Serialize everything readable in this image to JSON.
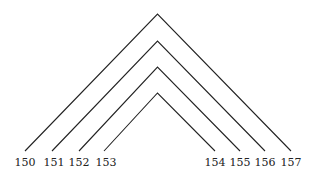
{
  "diagram": {
    "stroke_color": "#222222",
    "arcs": [
      {
        "left": "150",
        "right": "157",
        "apex": [
          157.5,
          14
        ],
        "left_end": [
          25,
          151
        ],
        "right_end": [
          291,
          151
        ]
      },
      {
        "left": "151",
        "right": "156",
        "apex": [
          157.5,
          41
        ],
        "left_end": [
          52,
          151
        ],
        "right_end": [
          265,
          151
        ]
      },
      {
        "left": "152",
        "right": "155",
        "apex": [
          157.5,
          67
        ],
        "left_end": [
          79,
          151
        ],
        "right_end": [
          240,
          151
        ]
      },
      {
        "left": "153",
        "right": "154",
        "apex": [
          157.5,
          93
        ],
        "left_end": [
          104,
          151
        ],
        "right_end": [
          215,
          151
        ]
      }
    ],
    "labels": [
      "150",
      "151",
      "152",
      "153",
      "154",
      "155",
      "156",
      "157"
    ]
  }
}
